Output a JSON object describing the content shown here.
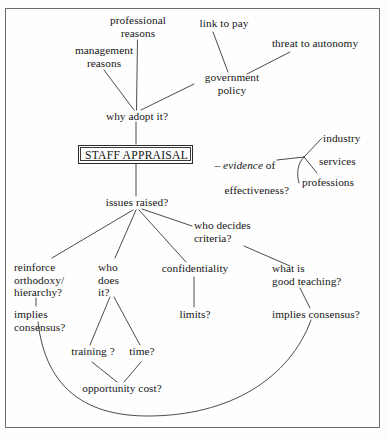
{
  "diagram": {
    "type": "mind-map",
    "root": "STAFF APPRAISAL",
    "stroke_color": "#2a2a2a",
    "border_color": "#6e6e6e",
    "background_color": "#fefefe"
  },
  "central": {
    "label": "STAFF APPRAISAL"
  },
  "nodes": {
    "professional_reasons": "professional\nreasons",
    "management_reasons": "management\nreasons",
    "link_to_pay": "link to pay",
    "threat_to_autonomy": "threat to autonomy",
    "government_policy": "government\npolicy",
    "why_adopt_it": "why adopt it?",
    "evidence_dash": "–",
    "evidence_word": "evidence",
    "evidence_rest": " of",
    "effectiveness": "effectiveness?",
    "industry": "industry",
    "services": "services",
    "professions": "professions",
    "issues_raised": "issues raised?",
    "who_decides_criteria": "who decides\ncriteria?",
    "reinforce_orthodoxy": "reinforce\northodoxy/\nhierarchy?",
    "implies_consensus_left": "implies\nconsensus?",
    "who_does_it": "who\ndoes\nit?",
    "confidentiality": "confidentiality",
    "limits": "limits?",
    "what_is_good_teaching": "what is\ngood teaching?",
    "implies_consensus_right": "implies consensus?",
    "training": "training ?",
    "time": "time?",
    "opportunity_cost": "opportunity cost?"
  },
  "edges": [
    {
      "from": "professional_reasons",
      "to": "why_adopt_it",
      "kind": "line"
    },
    {
      "from": "management_reasons",
      "to": "why_adopt_it",
      "kind": "line"
    },
    {
      "from": "link_to_pay",
      "to": "government_policy",
      "kind": "line"
    },
    {
      "from": "threat_to_autonomy",
      "to": "government_policy",
      "kind": "line"
    },
    {
      "from": "government_policy",
      "to": "why_adopt_it",
      "kind": "line"
    },
    {
      "from": "why_adopt_it",
      "to": "central",
      "kind": "line"
    },
    {
      "from": "central",
      "to": "issues_raised",
      "kind": "line"
    },
    {
      "from": "effectiveness",
      "to": "industry",
      "kind": "line"
    },
    {
      "from": "effectiveness",
      "to": "services",
      "kind": "line"
    },
    {
      "from": "effectiveness",
      "to": "professions",
      "kind": "curve"
    },
    {
      "from": "issues_raised",
      "to": "reinforce_orthodoxy",
      "kind": "line"
    },
    {
      "from": "issues_raised",
      "to": "who_does_it",
      "kind": "line"
    },
    {
      "from": "issues_raised",
      "to": "confidentiality",
      "kind": "line"
    },
    {
      "from": "issues_raised",
      "to": "who_decides_criteria",
      "kind": "line"
    },
    {
      "from": "who_decides_criteria",
      "to": "what_is_good_teaching",
      "kind": "line"
    },
    {
      "from": "reinforce_orthodoxy",
      "to": "implies_consensus_left",
      "kind": "line"
    },
    {
      "from": "confidentiality",
      "to": "limits",
      "kind": "line"
    },
    {
      "from": "what_is_good_teaching",
      "to": "implies_consensus_right",
      "kind": "line"
    },
    {
      "from": "who_does_it",
      "to": "training",
      "kind": "line"
    },
    {
      "from": "who_does_it",
      "to": "time",
      "kind": "line"
    },
    {
      "from": "training",
      "to": "opportunity_cost",
      "kind": "line"
    },
    {
      "from": "time",
      "to": "opportunity_cost",
      "kind": "line"
    },
    {
      "from": "implies_consensus_left",
      "to": "implies_consensus_right",
      "kind": "arc"
    }
  ]
}
